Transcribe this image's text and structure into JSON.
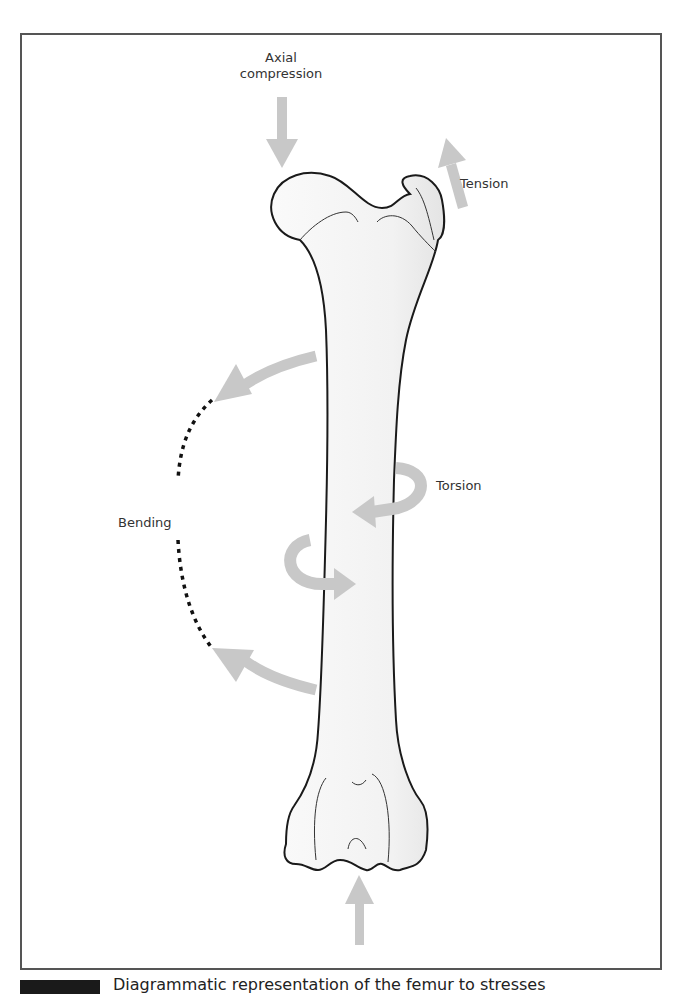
{
  "figure": {
    "labels": {
      "axial_compression": "Axial\ncompression",
      "axial_compression_line1": "Axial",
      "axial_compression_line2": "compression",
      "tension": "Tension",
      "torsion": "Torsion",
      "bending": "Bending"
    },
    "colors": {
      "arrow": "#c8c8c8",
      "bone_fill": "#f3f3f3",
      "bone_outline": "#1a1a1a",
      "frame": "#555555",
      "text": "#333333"
    }
  },
  "caption": {
    "text": "Diagrammatic representation of the femur to stresses"
  }
}
